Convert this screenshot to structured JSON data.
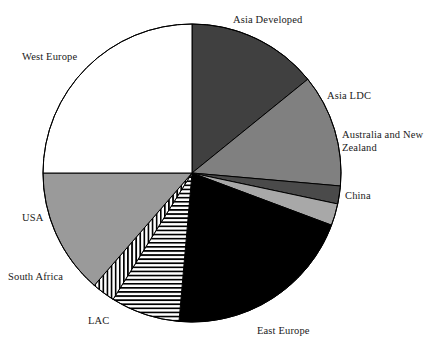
{
  "chart_data": {
    "type": "pie",
    "title": "",
    "subtitle": "",
    "xlabel": "",
    "ylabel": "",
    "legend_position": "none",
    "grid": false,
    "labels_placement": "outside-callout",
    "start_angle_deg": 0,
    "direction": "clockwise",
    "categories": [
      "Asia Developed",
      "Asia LDC",
      "Australia and New Zealand",
      "China",
      "East Europe",
      "LAC",
      "South Africa",
      "USA",
      "West Europe"
    ],
    "values": [
      14.2,
      12.2,
      1.9,
      2.4,
      20.7,
      7.5,
      2.5,
      13.6,
      25.0
    ],
    "units": "percent",
    "slices": [
      {
        "label": "Asia Developed",
        "value": 14.2,
        "start_deg": 0.0,
        "end_deg": 51.0,
        "fill": "#404040",
        "pattern": "solid",
        "label_x": 233,
        "label_y": 14,
        "label_align": "left"
      },
      {
        "label": "Asia LDC",
        "value": 12.2,
        "start_deg": 51.0,
        "end_deg": 95.0,
        "fill": "#808080",
        "pattern": "solid",
        "label_x": 327,
        "label_y": 90,
        "label_align": "left"
      },
      {
        "label": "Australia and New\nZealand",
        "value": 1.9,
        "start_deg": 95.0,
        "end_deg": 102.0,
        "fill": "#4a4a4a",
        "pattern": "solid",
        "label_x": 342,
        "label_y": 129,
        "label_align": "left"
      },
      {
        "label": "China",
        "value": 2.4,
        "start_deg": 102.0,
        "end_deg": 110.5,
        "fill": "#a8a8a8",
        "pattern": "solid",
        "label_x": 345,
        "label_y": 190,
        "label_align": "left"
      },
      {
        "label": "East Europe",
        "value": 20.7,
        "start_deg": 110.5,
        "end_deg": 185.0,
        "fill": "#000000",
        "pattern": "solid",
        "label_x": 257,
        "label_y": 325,
        "label_align": "left"
      },
      {
        "label": "LAC",
        "value": 7.5,
        "start_deg": 185.0,
        "end_deg": 212.0,
        "fill": "#ffffff",
        "pattern": "horizontal-stripes",
        "label_x": 88,
        "label_y": 315,
        "label_align": "left"
      },
      {
        "label": "South Africa",
        "value": 2.5,
        "start_deg": 212.0,
        "end_deg": 221.0,
        "fill": "#ffffff",
        "pattern": "vertical-stripes",
        "label_x": 8,
        "label_y": 271,
        "label_align": "left"
      },
      {
        "label": "USA",
        "value": 13.6,
        "start_deg": 221.0,
        "end_deg": 270.0,
        "fill": "#9a9a9a",
        "pattern": "solid",
        "label_x": 22,
        "label_y": 212,
        "label_align": "left"
      },
      {
        "label": "West Europe",
        "value": 25.0,
        "start_deg": 270.0,
        "end_deg": 360.0,
        "fill": "#ffffff",
        "pattern": "solid",
        "label_x": 22,
        "label_y": 51,
        "label_align": "left"
      }
    ],
    "geometry": {
      "center_x": 192,
      "center_y": 173,
      "radius": 149
    },
    "style": {
      "outline_color": "#000000",
      "outline_width": 1,
      "background": "#ffffff",
      "text_color": "#1a1a1a"
    }
  }
}
